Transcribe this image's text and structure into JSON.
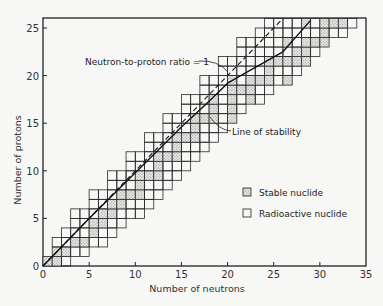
{
  "chart_data": {
    "type": "scatter",
    "title": "",
    "xlabel": "Number of neutrons",
    "ylabel": "Number of protons",
    "xlim": [
      0,
      35
    ],
    "ylim": [
      0,
      26
    ],
    "x_ticks": [
      0,
      5,
      10,
      15,
      20,
      25,
      30,
      35
    ],
    "y_ticks": [
      0,
      5,
      10,
      15,
      20,
      25
    ],
    "grid": false,
    "legend": {
      "position": "lower right",
      "entries": [
        {
          "label": "Stable nuclide",
          "style": "stippled square"
        },
        {
          "label": "Radioactive nuclide",
          "style": "open square"
        }
      ]
    },
    "annotations": [
      {
        "text": "Neutron-to-proton ratio = 1",
        "points_to": [
          20,
          21
        ]
      },
      {
        "text": "Line of stability",
        "points_to": [
          17,
          16
        ]
      }
    ],
    "series": [
      {
        "name": "Neutron-to-proton ratio = 1",
        "style": "dashed line",
        "x": [
          0,
          26
        ],
        "y": [
          0,
          26
        ]
      },
      {
        "name": "Line of stability",
        "style": "solid curve",
        "x": [
          0,
          5,
          10,
          15,
          18,
          20,
          22,
          26,
          29
        ],
        "y": [
          0,
          5,
          9.8,
          14.6,
          17.3,
          19.2,
          20.3,
          22.5,
          25.8
        ]
      }
    ],
    "nuclide_rows": [
      {
        "Z": 1,
        "N_min": 0,
        "N_max": 2,
        "stable_N": [
          0,
          1
        ]
      },
      {
        "Z": 2,
        "N_min": 1,
        "N_max": 4,
        "stable_N": [
          1,
          2
        ]
      },
      {
        "Z": 3,
        "N_min": 1,
        "N_max": 6,
        "stable_N": [
          3,
          4
        ]
      },
      {
        "Z": 4,
        "N_min": 2,
        "N_max": 7,
        "stable_N": [
          5
        ]
      },
      {
        "Z": 5,
        "N_min": 3,
        "N_max": 8,
        "stable_N": [
          5,
          6
        ]
      },
      {
        "Z": 6,
        "N_min": 3,
        "N_max": 10,
        "stable_N": [
          6,
          7
        ]
      },
      {
        "Z": 7,
        "N_min": 5,
        "N_max": 11,
        "stable_N": [
          7,
          8
        ]
      },
      {
        "Z": 8,
        "N_min": 5,
        "N_max": 12,
        "stable_N": [
          8,
          9,
          10
        ]
      },
      {
        "Z": 9,
        "N_min": 7,
        "N_max": 13,
        "stable_N": [
          10
        ]
      },
      {
        "Z": 10,
        "N_min": 7,
        "N_max": 14,
        "stable_N": [
          10,
          11,
          12
        ]
      },
      {
        "Z": 11,
        "N_min": 9,
        "N_max": 15,
        "stable_N": [
          12
        ]
      },
      {
        "Z": 12,
        "N_min": 9,
        "N_max": 16,
        "stable_N": [
          12,
          13,
          14
        ]
      },
      {
        "Z": 13,
        "N_min": 11,
        "N_max": 17,
        "stable_N": [
          14
        ]
      },
      {
        "Z": 14,
        "N_min": 11,
        "N_max": 18,
        "stable_N": [
          14,
          15,
          16
        ]
      },
      {
        "Z": 15,
        "N_min": 13,
        "N_max": 19,
        "stable_N": [
          16
        ]
      },
      {
        "Z": 16,
        "N_min": 13,
        "N_max": 20,
        "stable_N": [
          16,
          17,
          18,
          20
        ]
      },
      {
        "Z": 17,
        "N_min": 15,
        "N_max": 21,
        "stable_N": [
          18,
          20
        ]
      },
      {
        "Z": 18,
        "N_min": 15,
        "N_max": 23,
        "stable_N": [
          18,
          20,
          22
        ]
      },
      {
        "Z": 19,
        "N_min": 17,
        "N_max": 24,
        "stable_N": [
          20,
          21,
          22
        ]
      },
      {
        "Z": 20,
        "N_min": 17,
        "N_max": 26,
        "stable_N": [
          20,
          22,
          23,
          24,
          26
        ]
      },
      {
        "Z": 21,
        "N_min": 19,
        "N_max": 27,
        "stable_N": [
          24
        ]
      },
      {
        "Z": 22,
        "N_min": 19,
        "N_max": 28,
        "stable_N": [
          24,
          25,
          26,
          27,
          28
        ]
      },
      {
        "Z": 23,
        "N_min": 21,
        "N_max": 29,
        "stable_N": [
          27,
          28
        ]
      },
      {
        "Z": 24,
        "N_min": 21,
        "N_max": 30,
        "stable_N": [
          26,
          28,
          29,
          30
        ]
      },
      {
        "Z": 25,
        "N_min": 23,
        "N_max": 32,
        "stable_N": [
          30
        ]
      },
      {
        "Z": 26,
        "N_min": 24,
        "N_max": 33,
        "stable_N": [
          28,
          30,
          31,
          32
        ]
      }
    ]
  },
  "labels": {
    "xlabel": "Number of neutrons",
    "ylabel": "Number of protons",
    "ratio_annotation": "Neutron-to-proton ratio = 1",
    "stability_annotation": "Line of stability",
    "legend_stable": "Stable nuclide",
    "legend_radioactive": "Radioactive nuclide",
    "x_ticks": [
      "0",
      "5",
      "10",
      "15",
      "20",
      "25",
      "30",
      "35"
    ],
    "y_ticks": [
      "0",
      "5",
      "10",
      "15",
      "20",
      "25"
    ]
  }
}
